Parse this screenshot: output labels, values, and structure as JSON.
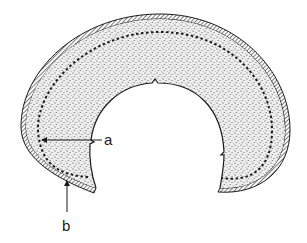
{
  "figure": {
    "labels": [
      {
        "id": "a",
        "text": "a",
        "points_to": "dashed inner layer"
      },
      {
        "id": "b",
        "text": "b",
        "points_to": "dashed inner layer (lower part)"
      }
    ],
    "colors": {
      "ink": "#1a1a1a",
      "stipple_fill": "#e9e9e9",
      "background": "#ffffff"
    }
  }
}
